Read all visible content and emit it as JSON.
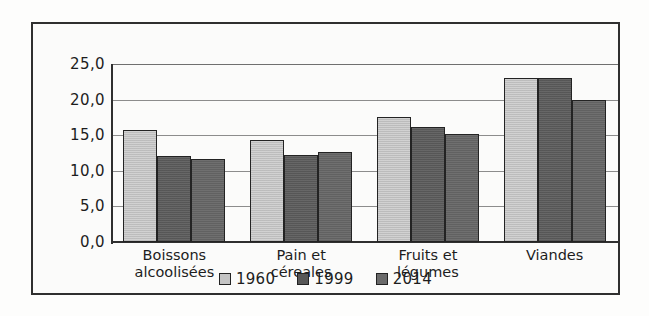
{
  "chart_data": {
    "type": "bar",
    "title": "",
    "subtitle": "",
    "xlabel": "",
    "ylabel": "",
    "ylim": [
      0.0,
      25.0
    ],
    "grid": true,
    "legend_position": "bottom-center",
    "categories": [
      "Boissons alcoolisées",
      "Pain et céreales",
      "Fruits et légumes",
      "Viandes"
    ],
    "category_lines": [
      [
        "Boissons",
        "alcoolisées"
      ],
      [
        "Pain et",
        "céreales"
      ],
      [
        "Fruits et",
        "légumes"
      ],
      [
        "Viandes"
      ]
    ],
    "yticks": [
      0.0,
      5.0,
      10.0,
      15.0,
      20.0,
      25.0
    ],
    "ytick_labels": [
      "0,0",
      "5,0",
      "10,0",
      "15,0",
      "20,0",
      "25,0"
    ],
    "series": [
      {
        "name": "1960",
        "color": "#c0c0c0",
        "values": [
          15.7,
          14.3,
          17.6,
          23.1
        ]
      },
      {
        "name": "1999",
        "color": "#5b5b5b",
        "values": [
          12.1,
          12.2,
          16.1,
          23.0
        ]
      },
      {
        "name": "2014",
        "color": "#666666",
        "values": [
          11.7,
          12.7,
          15.2,
          20.0
        ]
      }
    ]
  },
  "legend": {
    "items": [
      {
        "label": "1960"
      },
      {
        "label": "1999"
      },
      {
        "label": "2014"
      }
    ]
  }
}
